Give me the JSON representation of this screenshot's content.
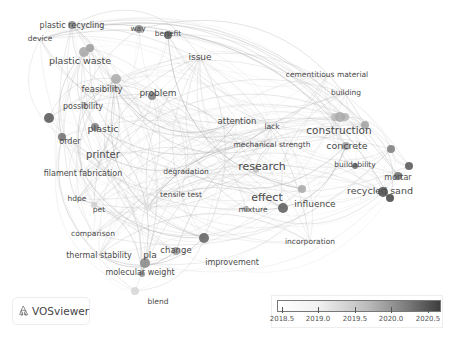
{
  "logo": {
    "text": "VOSviewer",
    "icon": "vosviewer-logo-icon"
  },
  "legend": {
    "gradient_start": "#ffffff",
    "gradient_end": "#3e3e3e",
    "ticks": [
      "2018.5",
      "2019.0",
      "2019.5",
      "2020.0",
      "2020.5"
    ]
  },
  "nodes": [
    {
      "label": "plastic recycling",
      "x": 72,
      "y": 25,
      "size": 8,
      "nx": 72,
      "ny": 25,
      "r": 4,
      "shade": "#8a8a8a"
    },
    {
      "label": "device",
      "x": 40,
      "y": 39,
      "size": 7.5,
      "nx": null,
      "ny": null,
      "r": 0,
      "shade": "#bdbdbd"
    },
    {
      "label": "way",
      "x": 138,
      "y": 29,
      "size": 7.5,
      "nx": 139,
      "ny": 29,
      "r": 4,
      "shade": "#8c8c8c"
    },
    {
      "label": "benefit",
      "x": 168,
      "y": 34,
      "size": 7.5,
      "nx": 168,
      "ny": 35,
      "r": 4,
      "shade": "#555555"
    },
    {
      "label": "issue",
      "x": 200,
      "y": 57,
      "size": 9,
      "nx": null,
      "ny": null,
      "r": 0,
      "shade": "#bdbdbd"
    },
    {
      "label": "plastic waste",
      "x": 80,
      "y": 61,
      "size": 9.5,
      "nx": 84,
      "ny": 52,
      "r": 5,
      "shade": "#a6a6a6"
    },
    {
      "label": "feasibility",
      "x": 102,
      "y": 89,
      "size": 8.5,
      "nx": 116,
      "ny": 79,
      "r": 5,
      "shade": "#a9a9a9"
    },
    {
      "label": "problem",
      "x": 158,
      "y": 93,
      "size": 9,
      "nx": 152,
      "ny": 96,
      "r": 4,
      "shade": "#7c7c7c"
    },
    {
      "label": "possibility",
      "x": 83,
      "y": 106,
      "size": 8,
      "nx": 84,
      "ny": 105,
      "r": 3,
      "shade": "#b5b5b5"
    },
    {
      "label": "plastic",
      "x": 103,
      "y": 129,
      "size": 9.5,
      "nx": 95,
      "ny": 127,
      "r": 4,
      "shade": "#7e7e7e"
    },
    {
      "label": "order",
      "x": 70,
      "y": 141,
      "size": 8,
      "nx": 62,
      "ny": 137,
      "r": 4,
      "shade": "#707070"
    },
    {
      "label": "printer",
      "x": 103,
      "y": 155,
      "size": 10,
      "nx": null,
      "ny": null,
      "r": 0,
      "shade": "#bdbdbd"
    },
    {
      "label": "filament fabrication",
      "x": 83,
      "y": 173,
      "size": 8,
      "nx": null,
      "ny": null,
      "r": 0,
      "shade": "#bdbdbd"
    },
    {
      "label": "hdpe",
      "x": 77,
      "y": 199,
      "size": 7.5,
      "nx": null,
      "ny": null,
      "r": 0,
      "shade": "#bdbdbd"
    },
    {
      "label": "pet",
      "x": 99,
      "y": 210,
      "size": 7.5,
      "nx": 94,
      "ny": 205,
      "r": 3,
      "shade": "#d0d0d0"
    },
    {
      "label": "comparison",
      "x": 93,
      "y": 234,
      "size": 7.5,
      "nx": null,
      "ny": null,
      "r": 0,
      "shade": "#bdbdbd"
    },
    {
      "label": "thermal stability",
      "x": 99,
      "y": 255,
      "size": 8,
      "nx": null,
      "ny": null,
      "r": 0,
      "shade": "#bdbdbd"
    },
    {
      "label": "pla",
      "x": 150,
      "y": 255,
      "size": 9,
      "nx": 145,
      "ny": 263,
      "r": 5,
      "shade": "#888888"
    },
    {
      "label": "change",
      "x": 176,
      "y": 250,
      "size": 8.5,
      "nx": 176,
      "ny": 251,
      "r": 4,
      "shade": "#9a9a9a"
    },
    {
      "label": "molecular weight",
      "x": 140,
      "y": 272,
      "size": 8,
      "nx": 142,
      "ny": 274,
      "r": 3,
      "shade": "#909090"
    },
    {
      "label": "blend",
      "x": 158,
      "y": 302,
      "size": 7.5,
      "nx": 135,
      "ny": 291,
      "r": 4,
      "shade": "#d6d6d6"
    },
    {
      "label": "improvement",
      "x": 232,
      "y": 262,
      "size": 8,
      "nx": 204,
      "ny": 238,
      "r": 5,
      "shade": "#5f5f5f"
    },
    {
      "label": "degradation",
      "x": 186,
      "y": 172,
      "size": 7.5,
      "nx": null,
      "ny": null,
      "r": 0,
      "shade": "#bdbdbd"
    },
    {
      "label": "tensile test",
      "x": 181,
      "y": 195,
      "size": 7.5,
      "nx": 148,
      "ny": 207,
      "r": 4,
      "shade": "#e0e0e0"
    },
    {
      "label": "attention",
      "x": 237,
      "y": 121,
      "size": 8.5,
      "nx": null,
      "ny": null,
      "r": 0,
      "shade": "#bdbdbd"
    },
    {
      "label": "lack",
      "x": 272,
      "y": 127,
      "size": 7.5,
      "nx": null,
      "ny": null,
      "r": 0,
      "shade": "#bdbdbd"
    },
    {
      "label": "mechanical strength",
      "x": 272,
      "y": 145,
      "size": 7.5,
      "nx": null,
      "ny": null,
      "r": 0,
      "shade": "#bdbdbd"
    },
    {
      "label": "research",
      "x": 262,
      "y": 167,
      "size": 11,
      "nx": 256,
      "ny": 170,
      "r": 3,
      "shade": "#bdbdbd"
    },
    {
      "label": "cementitious material",
      "x": 327,
      "y": 75,
      "size": 7.5,
      "nx": null,
      "ny": null,
      "r": 0,
      "shade": "#bdbdbd"
    },
    {
      "label": "building",
      "x": 346,
      "y": 93,
      "size": 7.5,
      "nx": null,
      "ny": null,
      "r": 0,
      "shade": "#bdbdbd"
    },
    {
      "label": "construction",
      "x": 339,
      "y": 131,
      "size": 10.5,
      "nx": 340,
      "ny": 117,
      "r": 5,
      "shade": "#a9a9a9"
    },
    {
      "label": "concrete",
      "x": 347,
      "y": 146,
      "size": 9.5,
      "nx": 346,
      "ny": 146,
      "r": 4,
      "shade": "#9e9e9e"
    },
    {
      "label": "buildability",
      "x": 355,
      "y": 165,
      "size": 7.5,
      "nx": 355,
      "ny": 166,
      "r": 3,
      "shade": "#6a6a6a"
    },
    {
      "label": "mortar",
      "x": 398,
      "y": 177,
      "size": 8,
      "nx": 409,
      "ny": 166,
      "r": 4,
      "shade": "#555555"
    },
    {
      "label": "recycled sand",
      "x": 380,
      "y": 191,
      "size": 9.5,
      "nx": 383,
      "ny": 192,
      "r": 5,
      "shade": "#4c4c4c"
    },
    {
      "label": "effect",
      "x": 267,
      "y": 198,
      "size": 11,
      "nx": 283,
      "ny": 208,
      "r": 5,
      "shade": "#5a5a5a"
    },
    {
      "label": "influence",
      "x": 315,
      "y": 204,
      "size": 9,
      "nx": 302,
      "ny": 189,
      "r": 4,
      "shade": "#a8a8a8"
    },
    {
      "label": "mixture",
      "x": 253,
      "y": 210,
      "size": 7.5,
      "nx": 246,
      "ny": 209,
      "r": 3,
      "shade": "#b0b0b0"
    },
    {
      "label": "incorporation",
      "x": 310,
      "y": 242,
      "size": 7.5,
      "nx": null,
      "ny": null,
      "r": 0,
      "shade": "#bdbdbd"
    }
  ],
  "extra_nodes": [
    {
      "x": 49,
      "y": 118,
      "r": 5,
      "shade": "#555555"
    },
    {
      "x": 335,
      "y": 117,
      "r": 4,
      "shade": "#b8b8b8"
    },
    {
      "x": 345,
      "y": 117,
      "r": 4,
      "shade": "#b3b3b3"
    },
    {
      "x": 365,
      "y": 125,
      "r": 4,
      "shade": "#a0a0a0"
    },
    {
      "x": 391,
      "y": 149,
      "r": 4,
      "shade": "#7b7b7b"
    },
    {
      "x": 398,
      "y": 176,
      "r": 4,
      "shade": "#6a6a6a"
    },
    {
      "x": 390,
      "y": 198,
      "r": 4,
      "shade": "#444444"
    },
    {
      "x": 115,
      "y": 88,
      "r": 3,
      "shade": "#c2c2c2"
    },
    {
      "x": 90,
      "y": 48,
      "r": 4,
      "shade": "#9a9a9a"
    }
  ]
}
